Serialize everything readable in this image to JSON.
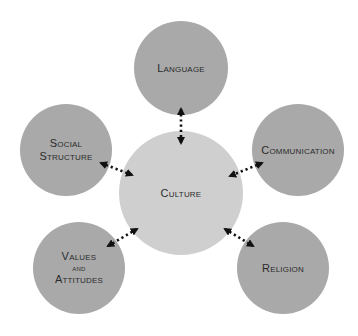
{
  "diagram": {
    "title": "",
    "center": {
      "id": "culture",
      "label": "Culture",
      "cx": 181,
      "cy": 193,
      "r": 62,
      "fill": "#cfcfcf"
    },
    "nodes": [
      {
        "id": "language",
        "label_lines": [
          "Language"
        ],
        "cx": 181,
        "cy": 68,
        "r": 47,
        "fill": "#a9a9a9"
      },
      {
        "id": "social-structure",
        "label_lines": [
          "Social",
          "Structure"
        ],
        "cx": 66,
        "cy": 150,
        "r": 46,
        "fill": "#a9a9a9"
      },
      {
        "id": "communication",
        "label_lines": [
          "Communication"
        ],
        "cx": 298,
        "cy": 150,
        "r": 46,
        "fill": "#a9a9a9"
      },
      {
        "id": "values-and-attitudes",
        "label_lines": [
          "Values",
          "and",
          "Attitudes"
        ],
        "cx": 79,
        "cy": 268,
        "r": 46,
        "fill": "#a9a9a9"
      },
      {
        "id": "religion",
        "label_lines": [
          "Religion"
        ],
        "cx": 283,
        "cy": 268,
        "r": 46,
        "fill": "#a9a9a9"
      }
    ],
    "connectors": [
      {
        "from": "culture",
        "to": "language",
        "style": "dotted",
        "arrows": "both",
        "x1": 181,
        "y1": 109,
        "x2": 181,
        "y2": 143
      },
      {
        "from": "culture",
        "to": "social-structure",
        "style": "dotted",
        "arrows": "both",
        "x1": 101,
        "y1": 163,
        "x2": 132,
        "y2": 175
      },
      {
        "from": "culture",
        "to": "communication",
        "style": "dotted",
        "arrows": "both",
        "x1": 262,
        "y1": 163,
        "x2": 230,
        "y2": 176
      },
      {
        "from": "culture",
        "to": "values-and-attitudes",
        "style": "dotted",
        "arrows": "both",
        "x1": 108,
        "y1": 246,
        "x2": 137,
        "y2": 229
      },
      {
        "from": "culture",
        "to": "religion",
        "style": "dotted",
        "arrows": "both",
        "x1": 225,
        "y1": 229,
        "x2": 253,
        "y2": 246
      }
    ],
    "colors": {
      "outer_fill": "#a9a9a9",
      "center_fill": "#cfcfcf",
      "text": "#2b2b2b",
      "connector": "#111111",
      "background": "#ffffff"
    }
  }
}
